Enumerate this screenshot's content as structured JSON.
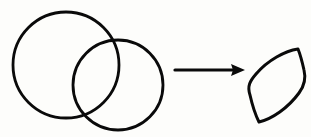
{
  "figure": {
    "title": "Two overlapping circles transform into their lens-shaped intersection",
    "background_color": "#fdfdfb",
    "stroke_color": "#0a0a0a",
    "canvas": {
      "width": 311,
      "height": 137
    },
    "relation_label": "yields",
    "operands": {
      "label": "overlapping-circle-pair",
      "circles": [
        {
          "name": "large-left-circle",
          "center_x": 66,
          "center_y": 65,
          "radius": 53,
          "stroke_width": 2.8
        },
        {
          "name": "small-right-circle",
          "center_x": 118,
          "center_y": 85,
          "radius": 45,
          "stroke_width": 2.8
        }
      ]
    },
    "arrow": {
      "name": "transformation-arrow",
      "direction": "right",
      "shaft_start_x": 175,
      "shaft_end_x": 237,
      "shaft_y": 70,
      "shaft_width": 3.2,
      "head_tip_x": 245,
      "head_back_x": 231,
      "head_half_height": 6
    },
    "result": {
      "name": "lens-vesica-shape",
      "description": "tilted lens (vesica piscis) formed by circle intersection",
      "stroke_width": 3.0,
      "vertices": {
        "top": {
          "x": 298,
          "y": 49
        },
        "bottom": {
          "x": 259,
          "y": 122
        },
        "left_bulge": {
          "x": 249,
          "y": 86
        },
        "right_bulge": {
          "x": 305,
          "y": 80
        }
      },
      "path": "M 298 49 C 285 51 268 60 256 74 C 250 81 247 86 250 95 C 252 104 255 114 259 122 C 272 119 288 108 299 93 C 305 85 306 78 304 70 C 302 61 300 54 298 49 Z"
    }
  }
}
